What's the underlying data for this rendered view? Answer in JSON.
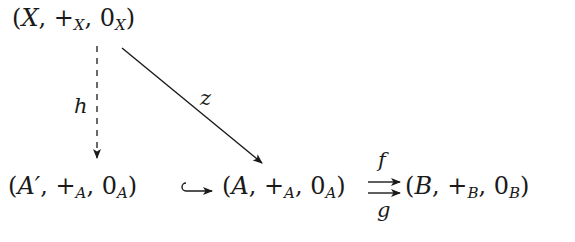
{
  "diagram": {
    "type": "commutative-diagram",
    "nodes": {
      "X": {
        "paren_open": "(",
        "var": "X",
        "comma1": ", ",
        "plus": "+",
        "plus_sub": "X",
        "comma2": ", ",
        "zero": "0",
        "zero_sub": "X",
        "paren_close": ")"
      },
      "Aprime": {
        "paren_open": "(",
        "var": "A′",
        "comma1": ", ",
        "plus": "+",
        "plus_sub": "A",
        "comma2": ", ",
        "zero": "0",
        "zero_sub": "A",
        "paren_close": ")"
      },
      "A": {
        "paren_open": "(",
        "var": "A",
        "comma1": ", ",
        "plus": "+",
        "plus_sub": "A",
        "comma2": ", ",
        "zero": "0",
        "zero_sub": "A",
        "paren_close": ")"
      },
      "B": {
        "paren_open": "(",
        "var": "B",
        "comma1": ", ",
        "plus": "+",
        "plus_sub": "B",
        "comma2": ", ",
        "zero": "0",
        "zero_sub": "B",
        "paren_close": ")"
      }
    },
    "edges": {
      "h": {
        "label": "h",
        "from": "X",
        "to": "Aprime",
        "style": "dashed"
      },
      "z": {
        "label": "z",
        "from": "X",
        "to": "A",
        "style": "solid"
      },
      "inclusion": {
        "label": "",
        "from": "Aprime",
        "to": "A",
        "style": "hook"
      },
      "f": {
        "label": "f",
        "from": "A",
        "to": "B",
        "style": "solid"
      },
      "g": {
        "label": "g",
        "from": "A",
        "to": "B",
        "style": "solid"
      }
    },
    "colors": {
      "ink": "#1a1a1a",
      "background": "#ffffff"
    }
  }
}
